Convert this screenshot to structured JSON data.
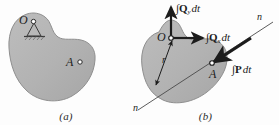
{
  "figure": {
    "background_color": "#fdfdfd",
    "body_fill_color": "#b4b4b4",
    "body_stroke_color": "#8c8c8c",
    "line_color": "#2b2b2b",
    "arrow_color": "#1c1c1c"
  },
  "panel_a": {
    "caption": "(a)",
    "point_o_label": "O",
    "point_a_label": "A",
    "support_type": "pin-support"
  },
  "panel_b": {
    "caption": "(b)",
    "point_o_label": "O",
    "point_a_label": "A",
    "radius_label": "r",
    "axis_label_top": "n",
    "axis_label_bottom": "n",
    "impulse_qy": {
      "integral": "∫",
      "symbol": "Q",
      "subscript": "y",
      "differential": "dt",
      "full": "∫Qᵧ dt"
    },
    "impulse_qx": {
      "integral": "∫",
      "symbol": "Q",
      "subscript": "x",
      "differential": "dt",
      "full": "∫Qₓ dt"
    },
    "impulse_p": {
      "integral": "∫",
      "symbol": "P",
      "subscript": "",
      "differential": "dt",
      "full": "∫P dt"
    }
  }
}
